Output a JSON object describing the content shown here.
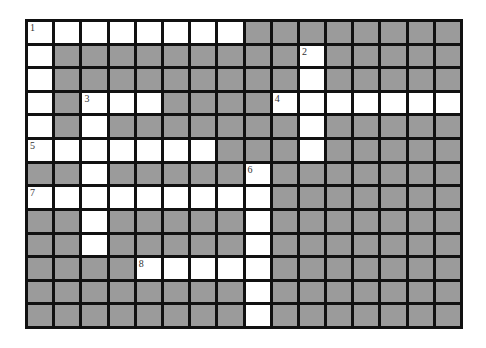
{
  "puzzle": {
    "rows": 13,
    "cols": 16,
    "colors": {
      "block": "#9b9b9b",
      "open": "#ffffff",
      "border": "#111111"
    },
    "entries": [
      {
        "number": "1",
        "direction": "across",
        "row": 0,
        "col": 0,
        "length": 8
      },
      {
        "number": "1",
        "direction": "down",
        "row": 0,
        "col": 0,
        "length": 6
      },
      {
        "number": "2",
        "direction": "down",
        "row": 1,
        "col": 10,
        "length": 5
      },
      {
        "number": "3",
        "direction": "across",
        "row": 3,
        "col": 2,
        "length": 3
      },
      {
        "number": "3",
        "direction": "down",
        "row": 3,
        "col": 2,
        "length": 7
      },
      {
        "number": "4",
        "direction": "across",
        "row": 3,
        "col": 9,
        "length": 7
      },
      {
        "number": "5",
        "direction": "across",
        "row": 5,
        "col": 0,
        "length": 7
      },
      {
        "number": "6",
        "direction": "down",
        "row": 6,
        "col": 8,
        "length": 7
      },
      {
        "number": "7",
        "direction": "across",
        "row": 7,
        "col": 0,
        "length": 9
      },
      {
        "number": "8",
        "direction": "across",
        "row": 10,
        "col": 4,
        "length": 5
      }
    ],
    "numbers": [
      {
        "label": "1",
        "row": 0,
        "col": 0
      },
      {
        "label": "2",
        "row": 1,
        "col": 10
      },
      {
        "label": "3",
        "row": 3,
        "col": 2
      },
      {
        "label": "4",
        "row": 3,
        "col": 9
      },
      {
        "label": "5",
        "row": 5,
        "col": 0
      },
      {
        "label": "6",
        "row": 6,
        "col": 8
      },
      {
        "label": "7",
        "row": 7,
        "col": 0
      },
      {
        "label": "8",
        "row": 10,
        "col": 4
      }
    ]
  }
}
